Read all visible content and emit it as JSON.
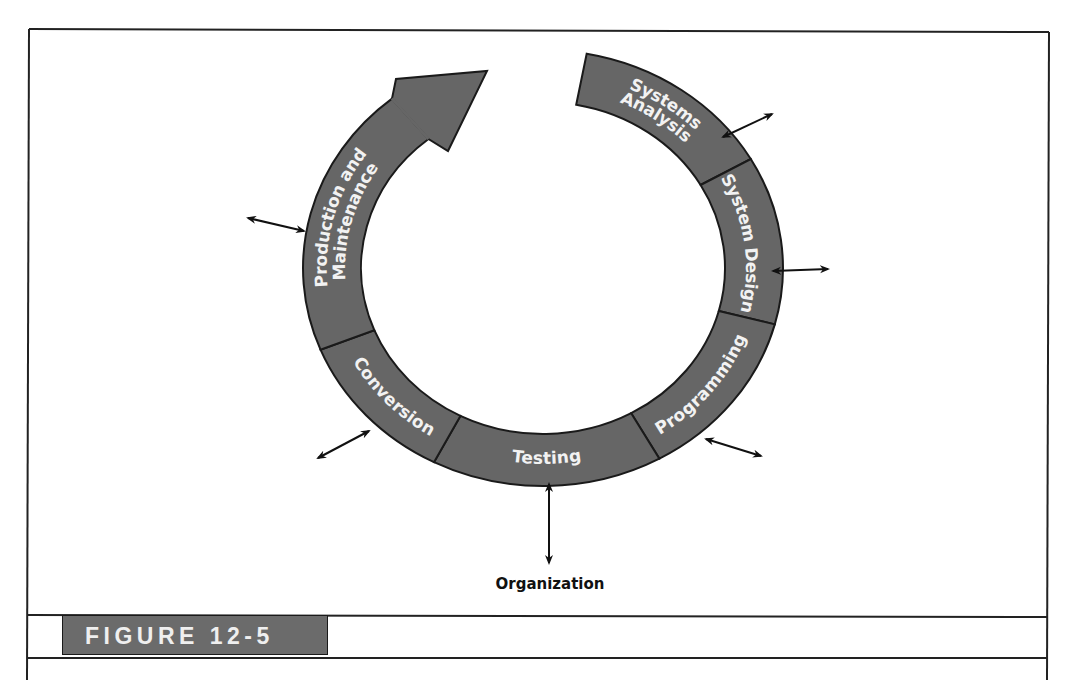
{
  "figure": {
    "caption_label": "FIGURE 12-5",
    "center_label": "Organization"
  },
  "colors": {
    "segment_fill": "#666666",
    "segment_stroke": "#1a1a1a",
    "segment_text": "#f2f2f2",
    "frame_stroke": "#222222",
    "caption_fill": "#6b6b6b"
  },
  "cycle": {
    "stages": [
      {
        "id": "systems-analysis",
        "label_lines": [
          "Systems",
          "Analysis"
        ],
        "start_deg": -79.5,
        "end_deg": -30
      },
      {
        "id": "system-design",
        "label_lines": [
          "System Design"
        ],
        "start_deg": -30,
        "end_deg": 15
      },
      {
        "id": "programming",
        "label_lines": [
          "Programming"
        ],
        "start_deg": 15,
        "end_deg": 61
      },
      {
        "id": "testing",
        "label_lines": [
          "Testing"
        ],
        "start_deg": 61,
        "end_deg": 117
      },
      {
        "id": "conversion",
        "label_lines": [
          "Conversion"
        ],
        "start_deg": 117,
        "end_deg": 158
      },
      {
        "id": "production-and-maintenance",
        "label_lines": [
          "Production and",
          "Maintenance"
        ],
        "start_deg": 158,
        "end_deg": 231
      }
    ],
    "organization_arrows": [
      {
        "stage": "systems-analysis",
        "x1": 723,
        "y1": 137,
        "x2": 772,
        "y2": 114
      },
      {
        "stage": "system-design",
        "x1": 773,
        "y1": 271,
        "x2": 828,
        "y2": 269
      },
      {
        "stage": "programming",
        "x1": 706,
        "y1": 439,
        "x2": 761,
        "y2": 456
      },
      {
        "stage": "testing",
        "x1": 549,
        "y1": 484,
        "x2": 549,
        "y2": 563
      },
      {
        "stage": "conversion",
        "x1": 369,
        "y1": 431,
        "x2": 318,
        "y2": 458
      },
      {
        "stage": "production-and-maintenance",
        "x1": 304,
        "y1": 231,
        "x2": 248,
        "y2": 218
      }
    ]
  }
}
